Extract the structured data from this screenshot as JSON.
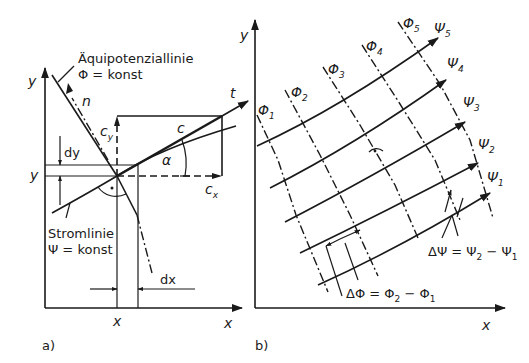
{
  "figure": {
    "panel_a": {
      "label": "a)",
      "axis_x_label": "x",
      "axis_y_label": "y",
      "point_x_label": "x",
      "point_y_label": "y",
      "equipotential_title": "Äquipotenziallinie",
      "equipotential_eq": "Φ = konst",
      "streamline_title": "Stromlinie",
      "streamline_eq": "Ψ = konst",
      "normal_label": "n",
      "tangent_label": "t",
      "velocity_label": "c",
      "cy_main": "c",
      "cy_sub": "y",
      "cx_main": "c",
      "cx_sub": "x",
      "angle_label": "α",
      "dy_label": "dy",
      "dx_label": "dx"
    },
    "panel_b": {
      "label": "b)",
      "axis_x_label": "x",
      "axis_y_label": "y",
      "phi_labels": [
        {
          "main": "Φ",
          "sub": "1"
        },
        {
          "main": "Φ",
          "sub": "2"
        },
        {
          "main": "Φ",
          "sub": "3"
        },
        {
          "main": "Φ",
          "sub": "4"
        },
        {
          "main": "Φ",
          "sub": "5"
        }
      ],
      "psi_labels": [
        {
          "main": "Ψ",
          "sub": "1"
        },
        {
          "main": "Ψ",
          "sub": "2"
        },
        {
          "main": "Ψ",
          "sub": "3"
        },
        {
          "main": "Ψ",
          "sub": "4"
        },
        {
          "main": "Ψ",
          "sub": "5"
        }
      ],
      "delta_psi": {
        "lhs": "ΔΨ = Ψ",
        "s1": "2",
        "mid": " − Ψ",
        "s2": "1"
      },
      "delta_phi": {
        "lhs": "ΔΦ = Φ",
        "s1": "2",
        "mid": " − Φ",
        "s2": "1"
      }
    }
  }
}
